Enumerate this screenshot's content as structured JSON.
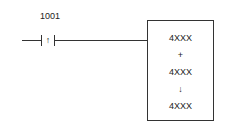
{
  "diagram": {
    "type": "ladder-logic",
    "contact": {
      "address": "1001",
      "kind": "positive-transition contact",
      "symbol": "↑"
    },
    "function_block": {
      "lines": [
        "4XXX",
        "+",
        "4XXX",
        "↓",
        "4XXX"
      ]
    }
  }
}
